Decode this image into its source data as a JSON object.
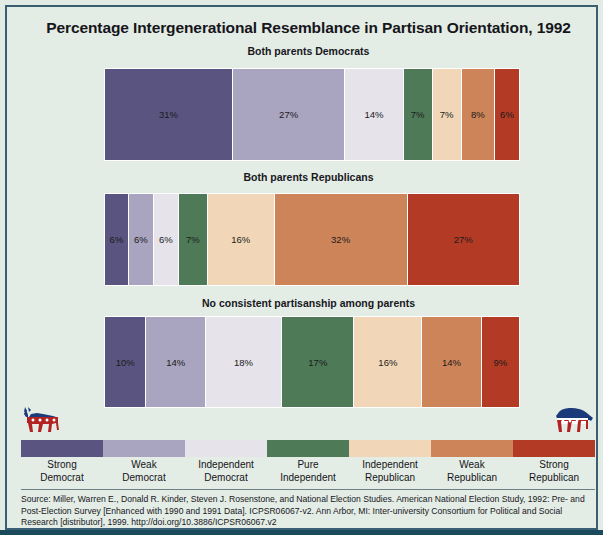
{
  "chart_data": {
    "type": "bar",
    "title": "Percentage Intergenerational Resemblance in Partisan Orientation, 1992",
    "xlabel": "",
    "ylabel": "",
    "orientation": "horizontal-stacked",
    "stacked": true,
    "xlim": [
      0,
      100
    ],
    "grid": false,
    "legend_position": "bottom",
    "value_suffix": "%",
    "categories": [
      "Strong Democrat",
      "Weak Democrat",
      "Independent Democrat",
      "Pure Independent",
      "Independent Republican",
      "Weak Republican",
      "Strong Republican"
    ],
    "category_colors": [
      "#5a5480",
      "#a9a4bf",
      "#e6e3eb",
      "#4e7a57",
      "#f1d7b8",
      "#cd8459",
      "#b33b25"
    ],
    "series": [
      {
        "name": "Both parents Democrats",
        "values": [
          31,
          27,
          14,
          7,
          7,
          8,
          6
        ],
        "labels": [
          "31%",
          "27%",
          "14%",
          "7%",
          "7%",
          "8%",
          "6%"
        ]
      },
      {
        "name": "Both parents Republicans",
        "values": [
          6,
          6,
          6,
          7,
          16,
          32,
          27
        ],
        "labels": [
          "6%",
          "6%",
          "6%",
          "7%",
          "16%",
          "32%",
          "27%"
        ]
      },
      {
        "name": "No consistent partisanship among parents",
        "values": [
          10,
          14,
          18,
          17,
          16,
          14,
          9
        ],
        "labels": [
          "10%",
          "14%",
          "18%",
          "17%",
          "16%",
          "14%",
          "9%"
        ]
      }
    ],
    "legend": [
      {
        "label_line1": "Strong",
        "label_line2": "Democrat",
        "color": "#5a5480"
      },
      {
        "label_line1": "Weak",
        "label_line2": "Democrat",
        "color": "#a9a4bf"
      },
      {
        "label_line1": "Independent",
        "label_line2": "Democrat",
        "color": "#e6e3eb"
      },
      {
        "label_line1": "Pure",
        "label_line2": "Independent",
        "color": "#4e7a57"
      },
      {
        "label_line1": "Independent",
        "label_line2": "Republican",
        "color": "#f1d7b8"
      },
      {
        "label_line1": "Weak",
        "label_line2": "Republican",
        "color": "#cd8459"
      },
      {
        "label_line1": "Strong",
        "label_line2": "Republican",
        "color": "#b33b25"
      }
    ],
    "source": "Source: Miller, Warren E., Donald R. Kinder, Steven J. Rosenstone, and National Election Studies. American National Election Study, 1992: Pre- and Post-Election Survey [Enhanced with 1990 and 1991 Data]. ICPSR06067-v2. Ann Arbor, MI: Inter-university Consortium for Political and Social Research [distributor], 1999. http://doi.org/10.3886/ICPSR06067.v2"
  },
  "icons": {
    "democrat_logo": "donkey-icon",
    "republican_logo": "elephant-icon"
  },
  "colors": {
    "page_background": "#e4ece6",
    "frame_border": "#3a5f73",
    "outer_background": "#1b4a5c",
    "text": "#15161a"
  }
}
